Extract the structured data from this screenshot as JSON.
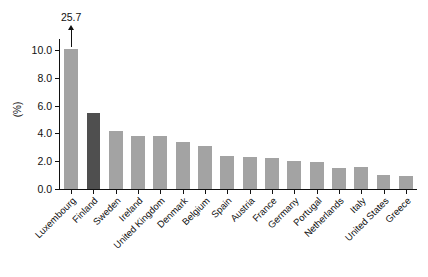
{
  "chart_data": {
    "type": "bar",
    "title": "",
    "subtitle": "",
    "xlabel": "",
    "ylabel": "(%)",
    "ylim": [
      0.0,
      10.8
    ],
    "grid": false,
    "legend": null,
    "ytick_labels": [
      "0.0",
      "2.0",
      "4.0",
      "6.0",
      "8.0",
      "10.0"
    ],
    "ytick_values": [
      0.0,
      2.0,
      4.0,
      6.0,
      8.0,
      10.0
    ],
    "categories": [
      "Luxembourg",
      "Finland",
      "Sweden",
      "Ireland",
      "United Kingdom",
      "Denmark",
      "Belgium",
      "Spain",
      "Austria",
      "France",
      "Germany",
      "Portugal",
      "Netherlands",
      "Italy",
      "United States",
      "Greece"
    ],
    "values": [
      25.7,
      5.5,
      4.2,
      3.8,
      3.8,
      3.4,
      3.1,
      2.4,
      2.3,
      2.25,
      2.0,
      1.95,
      1.5,
      1.55,
      1.0,
      0.95
    ],
    "clipped_bars": [
      {
        "category": "Luxembourg",
        "displayed_top": 10.1,
        "true_value": 25.7,
        "annotation": "25.7"
      }
    ],
    "highlighted": [
      "Finland"
    ],
    "colors": {
      "bar": "#a3a3a3",
      "bar_highlight": "#4f4f4f",
      "axis": "#111111",
      "text": "#111111",
      "background": "#ffffff"
    },
    "annotations": [
      {
        "text": "25.7",
        "target": "Luxembourg",
        "kind": "clipped-bar-arrow"
      }
    ]
  }
}
